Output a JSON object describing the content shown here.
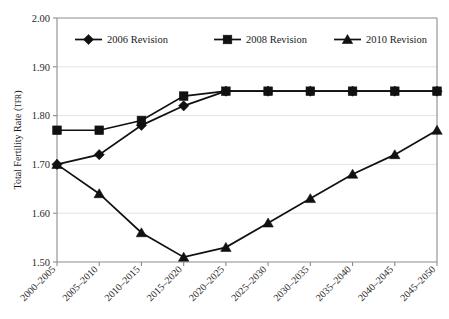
{
  "chart_data": {
    "type": "line",
    "title": "",
    "xlabel": "",
    "ylabel": "Total Fertility Rate (TFR)",
    "ylabel_main": "Total Fertility Rate (",
    "ylabel_smallcaps": "TFR",
    "ylabel_close": ")",
    "ylim": [
      1.5,
      2.0
    ],
    "ytick_step": 0.1,
    "grid": true,
    "grid_axis": "y",
    "legend_position": "top-inside",
    "categories": [
      "2000–2005",
      "2005–2010",
      "2010–2015",
      "2015–2020",
      "2020–2025",
      "2025–2030",
      "2030–2035",
      "2035–2040",
      "2040–2045",
      "2045–2050"
    ],
    "ytick_labels": [
      "1.50",
      "1.60",
      "1.70",
      "1.80",
      "1.90",
      "2.00"
    ],
    "ytick_values": [
      1.5,
      1.6,
      1.7,
      1.8,
      1.9,
      2.0
    ],
    "series": [
      {
        "name": "2006 Revision",
        "marker": "diamond",
        "color": "#111111",
        "values": [
          1.7,
          1.72,
          1.78,
          1.82,
          1.85,
          1.85,
          1.85,
          1.85,
          1.85,
          1.85
        ]
      },
      {
        "name": "2008 Revision",
        "marker": "square",
        "color": "#111111",
        "values": [
          1.77,
          1.77,
          1.79,
          1.84,
          1.85,
          1.85,
          1.85,
          1.85,
          1.85,
          1.85
        ]
      },
      {
        "name": "2010 Revision",
        "marker": "triangle",
        "color": "#111111",
        "values": [
          1.7,
          1.64,
          1.56,
          1.51,
          1.53,
          1.58,
          1.63,
          1.68,
          1.72,
          1.77
        ]
      }
    ]
  },
  "legend": {
    "entries": [
      {
        "label": "2006 Revision",
        "marker": "diamond"
      },
      {
        "label": "2008 Revision",
        "marker": "square"
      },
      {
        "label": "2010 Revision",
        "marker": "triangle"
      }
    ]
  },
  "colors": {
    "background": "#ffffff",
    "ink": "#111111",
    "frame": "#8c8c8c",
    "gridline": "#e3e3e3",
    "tick_text": "#2b2b2b"
  }
}
